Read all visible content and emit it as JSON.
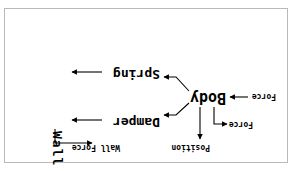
{
  "figure": {
    "orientation": "rotated-180",
    "background_color": "#ffffff",
    "border_color": "#b9b9b9",
    "line_color": "#000000"
  },
  "nodes": [
    {
      "id": "body",
      "label": "Body",
      "name": "node-body"
    },
    {
      "id": "damper",
      "label": "Damper",
      "name": "node-damper"
    },
    {
      "id": "spring",
      "label": "Spring",
      "name": "node-spring"
    },
    {
      "id": "wall",
      "label": "Wall",
      "name": "node-wall",
      "orientation": "vertical"
    }
  ],
  "edge_labels": [
    {
      "id": "force_in",
      "label": "Force"
    },
    {
      "id": "force_out",
      "label": "Force"
    },
    {
      "id": "position",
      "label": "Position"
    },
    {
      "id": "wall_force",
      "label": "Wall Force"
    }
  ],
  "edges": [
    {
      "from": "force_in_label",
      "to": "body",
      "arrow": "to"
    },
    {
      "from": "body",
      "to": "force_out_label",
      "arrow": "to"
    },
    {
      "from": "body",
      "to": "position_label",
      "arrow": "to"
    },
    {
      "from": "body",
      "to": "damper",
      "arrow": "to"
    },
    {
      "from": "body",
      "to": "spring",
      "arrow": "to"
    },
    {
      "from": "damper",
      "to": "wall",
      "arrow": "to"
    },
    {
      "from": "spring",
      "to": "wall",
      "arrow": "to"
    },
    {
      "from": "wall",
      "to": "wall_force_label",
      "arrow": "to"
    }
  ]
}
